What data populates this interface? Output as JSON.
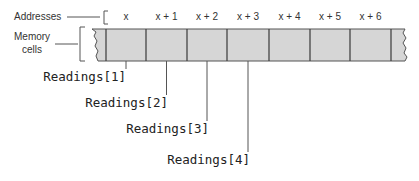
{
  "labels": {
    "addresses": "Addresses",
    "memory_line1": "Memory",
    "memory_line2": "cells"
  },
  "addresses": [
    "x",
    "x + 1",
    "x + 2",
    "x + 3",
    "x + 4",
    "x + 5",
    "x + 6"
  ],
  "readings": [
    "Readings[1]",
    "Readings[2]",
    "Readings[3]",
    "Readings[4]"
  ],
  "colors": {
    "cell_fill": "#d6d6d6",
    "line": "#555555"
  }
}
